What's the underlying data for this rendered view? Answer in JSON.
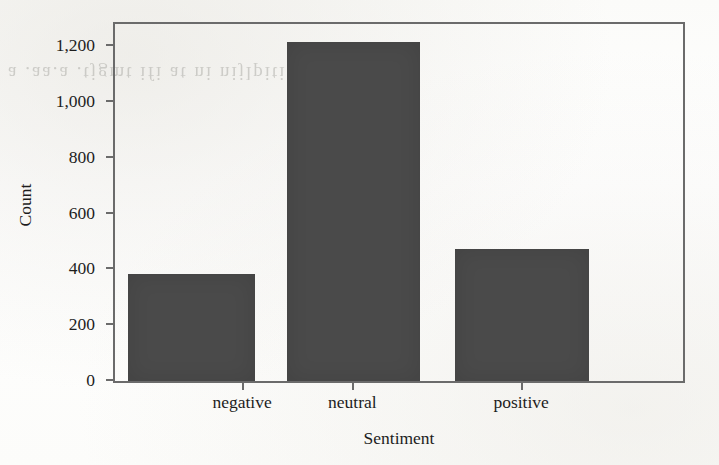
{
  "figure": {
    "width": 719,
    "height": 465,
    "background_color": "#fdfdfc",
    "scan_artifact_text": "a .aa.a .tjgmt ifi at ni nijlpiti a'an a",
    "frame_color": "#6b6b6b",
    "text_color": "#1d1d1d"
  },
  "chart_data": {
    "type": "bar",
    "title": "",
    "xlabel": "Sentiment",
    "ylabel": "Count",
    "categories": [
      "negative",
      "neutral",
      "positive"
    ],
    "values": [
      382,
      1215,
      474
    ],
    "bar_color": "#4a4a4a",
    "ylim": [
      0,
      1280
    ],
    "yticks": [
      0,
      200,
      400,
      600,
      800,
      1000,
      1200
    ],
    "ytick_labels": [
      "0",
      "200",
      "400",
      "600",
      "800",
      "1,000",
      "1,200"
    ],
    "grid": false,
    "legend": false,
    "legend_position": "none",
    "bar_geometry": [
      {
        "left_pct": 2.27,
        "width_pct": 22.38
      },
      {
        "left_pct": 30.24,
        "width_pct": 23.43
      },
      {
        "left_pct": 59.79,
        "width_pct": 23.6
      }
    ],
    "xtick_positions_pct": [
      22.38,
      41.78,
      71.5
    ]
  }
}
